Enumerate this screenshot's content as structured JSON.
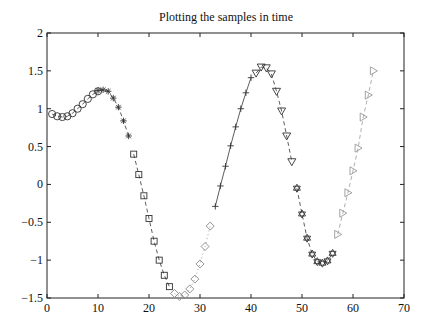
{
  "chart_data": {
    "type": "line",
    "title": "Plotting the samples in time",
    "xlabel": "",
    "ylabel": "",
    "xlim": [
      0,
      70
    ],
    "ylim": [
      -1.5,
      2
    ],
    "xticks": [
      0,
      10,
      20,
      30,
      40,
      50,
      60,
      70
    ],
    "yticks": [
      -1.5,
      -1,
      -0.5,
      0,
      0.5,
      1,
      1.5,
      2
    ],
    "xtick_labels": [
      "0",
      "10",
      "20",
      "30",
      "40",
      "50",
      "60",
      "70"
    ],
    "ytick_labels": [
      "−1.5",
      "−1",
      "−0.5",
      "0",
      "0.5",
      "1",
      "1.5",
      "2"
    ],
    "grid": false,
    "legend": null,
    "series": [
      {
        "name": "samples 1-8",
        "marker": "circle",
        "line": "dashed",
        "color": "#333333",
        "x": [
          1,
          2,
          3,
          4,
          5,
          6,
          7,
          8,
          9,
          10
        ],
        "y": [
          0.93,
          0.9,
          0.89,
          0.9,
          0.94,
          1.0,
          1.06,
          1.13,
          1.19,
          1.23
        ]
      },
      {
        "name": "samples 9-16",
        "marker": "star",
        "line": "dashed",
        "color": "#333333",
        "x": [
          10,
          11,
          12,
          13,
          14,
          15,
          16
        ],
        "y": [
          1.24,
          1.25,
          1.23,
          1.14,
          1.02,
          0.84,
          0.64
        ]
      },
      {
        "name": "samples 17-24",
        "marker": "square",
        "line": "dashed",
        "color": "#333333",
        "x": [
          17,
          18,
          19,
          20,
          21,
          22,
          23,
          24
        ],
        "y": [
          0.4,
          0.13,
          -0.15,
          -0.45,
          -0.75,
          -1.0,
          -1.2,
          -1.35
        ]
      },
      {
        "name": "samples 25-32",
        "marker": "diamond",
        "line": "dotted",
        "color": "#888888",
        "x": [
          25,
          26,
          27,
          28,
          29,
          30,
          31,
          32
        ],
        "y": [
          -1.44,
          -1.48,
          -1.46,
          -1.38,
          -1.25,
          -1.05,
          -0.82,
          -0.55
        ]
      },
      {
        "name": "samples 33-40",
        "marker": "plus",
        "line": "solid",
        "color": "#333333",
        "x": [
          33,
          34,
          35,
          36,
          37,
          38,
          39,
          40
        ],
        "y": [
          -0.29,
          -0.02,
          0.24,
          0.51,
          0.76,
          1.0,
          1.21,
          1.41
        ]
      },
      {
        "name": "samples 41-48",
        "marker": "triangle-down",
        "line": "dashed",
        "color": "#333333",
        "x": [
          41,
          42,
          43,
          44,
          45,
          46,
          47,
          48
        ],
        "y": [
          1.47,
          1.55,
          1.54,
          1.46,
          1.23,
          0.97,
          0.64,
          0.3
        ]
      },
      {
        "name": "samples 49-56",
        "marker": "hexagram",
        "line": "dashed",
        "color": "#333333",
        "x": [
          49,
          50,
          51,
          52,
          53,
          54,
          55,
          56
        ],
        "y": [
          -0.05,
          -0.39,
          -0.71,
          -0.92,
          -1.02,
          -1.04,
          -1.01,
          -0.91
        ]
      },
      {
        "name": "samples 57-64",
        "marker": "triangle-right",
        "line": "dashed",
        "color": "#999999",
        "x": [
          57,
          58,
          59,
          60,
          61,
          62,
          63,
          64
        ],
        "y": [
          -0.66,
          -0.38,
          -0.11,
          0.18,
          0.48,
          0.89,
          1.18,
          1.5
        ]
      }
    ]
  },
  "plot_area": {
    "left": 47,
    "top": 33,
    "right": 404,
    "bottom": 298
  }
}
